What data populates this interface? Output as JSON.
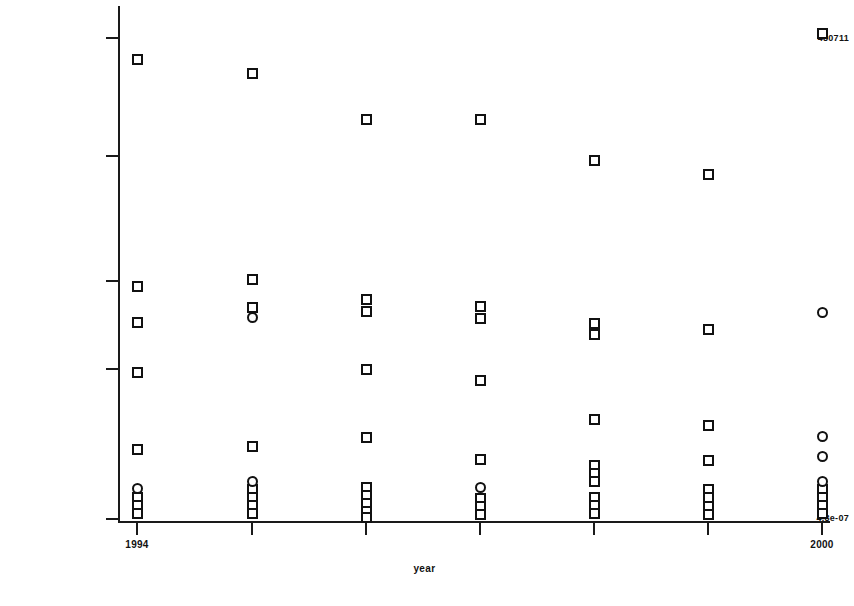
{
  "chart_data": {
    "type": "scatter",
    "title": "",
    "subtitle": "",
    "xlabel": "year",
    "ylabel": "",
    "grid": false,
    "legend": null,
    "xlim": [
      1994,
      2000
    ],
    "ylim_labels": [
      "4.8e-07",
      "480711"
    ],
    "y_axis": {
      "scale": "log",
      "min_label": "4.8e-07",
      "max_label": "480711",
      "tick_labels": [
        "480711",
        "",
        "",
        "",
        "4.8e-07"
      ],
      "tick_pixel_y": [
        37,
        155,
        280,
        368,
        518
      ]
    },
    "x_axis": {
      "tick_labels": [
        "1994",
        "",
        "",
        "",
        "",
        "",
        "2000"
      ],
      "categories": [
        1994,
        1995,
        1996,
        1997,
        1998,
        1999,
        2000
      ],
      "tick_pixel_x": [
        137,
        252,
        366,
        480,
        594,
        708,
        822
      ]
    },
    "marker_shapes": [
      "square",
      "circle"
    ],
    "series": [
      {
        "name": "square",
        "shape": "square",
        "points": [
          {
            "x": 1994,
            "py": 59
          },
          {
            "x": 1994,
            "py": 286
          },
          {
            "x": 1994,
            "py": 322
          },
          {
            "x": 1994,
            "py": 372
          },
          {
            "x": 1994,
            "py": 449
          },
          {
            "x": 1994,
            "py": 497
          },
          {
            "x": 1994,
            "py": 505
          },
          {
            "x": 1994,
            "py": 513
          },
          {
            "x": 1995,
            "py": 73
          },
          {
            "x": 1995,
            "py": 279
          },
          {
            "x": 1995,
            "py": 307
          },
          {
            "x": 1995,
            "py": 446
          },
          {
            "x": 1995,
            "py": 489
          },
          {
            "x": 1995,
            "py": 497
          },
          {
            "x": 1995,
            "py": 505
          },
          {
            "x": 1995,
            "py": 513
          },
          {
            "x": 1996,
            "py": 119
          },
          {
            "x": 1996,
            "py": 299
          },
          {
            "x": 1996,
            "py": 311
          },
          {
            "x": 1996,
            "py": 369
          },
          {
            "x": 1996,
            "py": 437
          },
          {
            "x": 1996,
            "py": 487
          },
          {
            "x": 1996,
            "py": 495
          },
          {
            "x": 1996,
            "py": 503
          },
          {
            "x": 1996,
            "py": 511
          },
          {
            "x": 1996,
            "py": 517
          },
          {
            "x": 1997,
            "py": 119
          },
          {
            "x": 1997,
            "py": 306
          },
          {
            "x": 1997,
            "py": 318
          },
          {
            "x": 1997,
            "py": 380
          },
          {
            "x": 1997,
            "py": 459
          },
          {
            "x": 1997,
            "py": 498
          },
          {
            "x": 1997,
            "py": 506
          },
          {
            "x": 1997,
            "py": 514
          },
          {
            "x": 1998,
            "py": 160
          },
          {
            "x": 1998,
            "py": 323
          },
          {
            "x": 1998,
            "py": 334
          },
          {
            "x": 1998,
            "py": 419
          },
          {
            "x": 1998,
            "py": 465
          },
          {
            "x": 1998,
            "py": 473
          },
          {
            "x": 1998,
            "py": 481
          },
          {
            "x": 1998,
            "py": 497
          },
          {
            "x": 1998,
            "py": 505
          },
          {
            "x": 1998,
            "py": 513
          },
          {
            "x": 1999,
            "py": 174
          },
          {
            "x": 1999,
            "py": 329
          },
          {
            "x": 1999,
            "py": 425
          },
          {
            "x": 1999,
            "py": 460
          },
          {
            "x": 1999,
            "py": 489
          },
          {
            "x": 1999,
            "py": 497
          },
          {
            "x": 1999,
            "py": 506
          },
          {
            "x": 1999,
            "py": 514
          },
          {
            "x": 2000,
            "py": 33
          },
          {
            "x": 2000,
            "py": 489
          },
          {
            "x": 2000,
            "py": 497
          },
          {
            "x": 2000,
            "py": 505
          },
          {
            "x": 2000,
            "py": 513
          }
        ]
      },
      {
        "name": "circle",
        "shape": "circle",
        "points": [
          {
            "x": 1994,
            "py": 488
          },
          {
            "x": 1995,
            "py": 317
          },
          {
            "x": 1995,
            "py": 481
          },
          {
            "x": 1997,
            "py": 487
          },
          {
            "x": 2000,
            "py": 312
          },
          {
            "x": 2000,
            "py": 436
          },
          {
            "x": 2000,
            "py": 456
          },
          {
            "x": 2000,
            "py": 481
          }
        ]
      }
    ]
  },
  "axis": {
    "y_top_label": "480711",
    "y_bottom_label": "4.8e-07",
    "x_left_label": "1994",
    "x_right_label": "2000",
    "x_title": "year"
  }
}
